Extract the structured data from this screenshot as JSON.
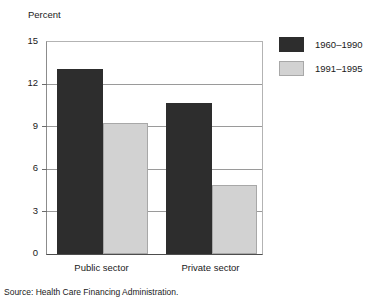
{
  "chart_data": {
    "type": "bar",
    "title": "",
    "ylabel": "Percent",
    "xlabel": "",
    "ylim": [
      0,
      15
    ],
    "yticks": [
      0,
      3,
      6,
      9,
      12,
      15
    ],
    "ytick_labels": [
      "0",
      "3",
      "6",
      "9",
      "12",
      "15"
    ],
    "grid": true,
    "legend_position": "right-top",
    "categories": [
      "Public sector",
      "Private sector"
    ],
    "series": [
      {
        "name": "1960–1990",
        "color": "#2d2d2d",
        "values": [
          13.1,
          10.7
        ]
      },
      {
        "name": "1991–1995",
        "color": "#d2d2d2",
        "values": [
          9.3,
          4.9
        ]
      }
    ],
    "source_note": "Source: Health Care Financing Administration."
  },
  "legend": {
    "items": [
      {
        "label": "1960–1990",
        "swatch": "dark-swatch"
      },
      {
        "label": "1991–1995",
        "swatch": "light-swatch"
      }
    ]
  },
  "colors": {
    "series_1": "#2d2d2d",
    "series_2": "#d2d2d2",
    "gridline": "#9a9a9a",
    "axis": "#4d4d4d",
    "text": "#1a1a1a",
    "background": "#ffffff"
  }
}
